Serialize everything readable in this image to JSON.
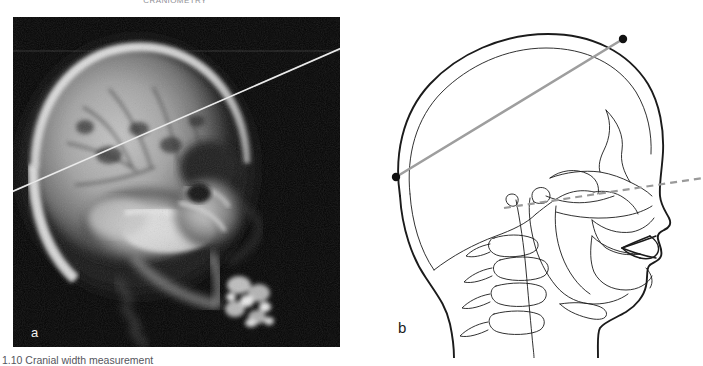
{
  "figure": {
    "top_caption": "CRANIOMETRY",
    "bottom_caption": "1.10 Cranial width measurement",
    "panel_a_label": "a",
    "panel_b_label": "b",
    "panel_a_description": "Lateral cephalometric radiograph of skull with measurement line",
    "panel_b_description": "Cephalometric tracing of skull with landmark points and reference lines",
    "background_color": "#ffffff",
    "radiograph_background": "#050505",
    "measurement_line_color": "#cfcfcf",
    "tracing_line_color": "#1b1b1b",
    "reference_line_color": "#9a9a9a",
    "landmark_color": "#111111"
  },
  "panel_a": {
    "measurement_line": {
      "name": "cranial-measurement-line",
      "x1": 0,
      "y1": 175,
      "x2": 327,
      "y2": 31,
      "color": "#d2d2d2",
      "width": 1.6
    },
    "scan_line": {
      "name": "film-scan-line",
      "x1": 0,
      "y1": 34,
      "x2": 327,
      "y2": 34,
      "color": "#2a2a2a"
    }
  },
  "panel_b": {
    "landmarks": [
      {
        "name": "landmark-euryon-right",
        "cx": 263,
        "cy": 33,
        "r": 4.1
      },
      {
        "name": "landmark-euryon-left",
        "cx": 36,
        "cy": 171,
        "r": 4.1
      }
    ],
    "solid_reference_line": {
      "name": "cranial-width-line",
      "x1": 36,
      "y1": 171,
      "x2": 263,
      "y2": 33,
      "color": "#9e9e9e",
      "width": 2.6
    },
    "dashed_reference_line": {
      "name": "frankfort-horizontal-line",
      "x1": 144,
      "y1": 201,
      "x2": 343,
      "y2": 173,
      "color": "#9a9a9a",
      "width": 2.2,
      "dash": "7 5"
    }
  }
}
